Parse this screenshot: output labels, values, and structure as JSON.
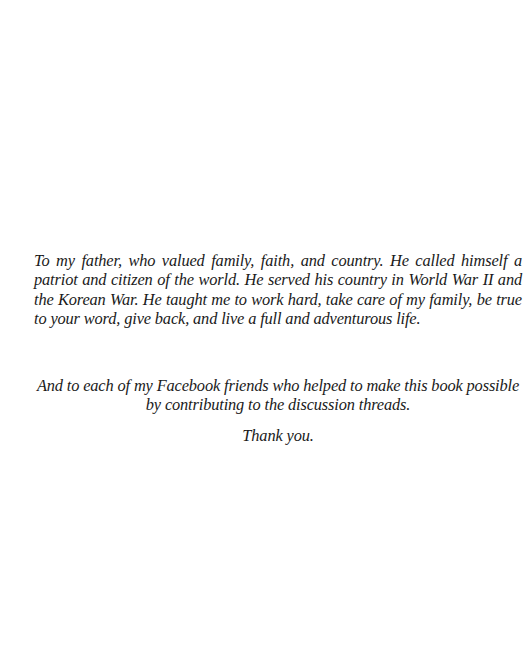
{
  "dedication": {
    "paragraphs": [
      "To my father, who valued family, faith, and country. He called himself a patriot and citizen of the world. He served his country in World War II and the Korean War. He taught me to work hard, take care of my family, be true to your word, give back, and live a full and adventurous life.",
      "And to each of my Facebook friends who helped to make this book possible by contributing to the discussion threads.",
      "Thank you."
    ]
  },
  "colors": {
    "background": "#ffffff",
    "text": "#1a1a1a"
  }
}
